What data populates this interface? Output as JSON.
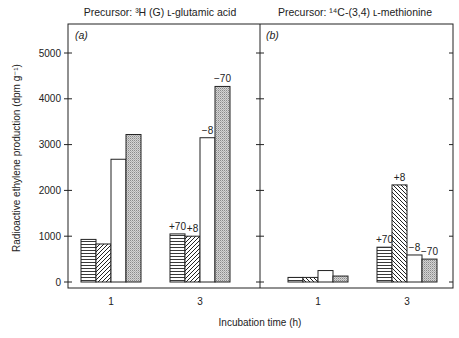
{
  "chart_data": [
    {
      "type": "bar",
      "panel_label": "(a)",
      "title": "Precursor: ³H (G) ʟ-glutamic acid",
      "xlabel": "Incubation time (h)",
      "ylabel": "Radioactive ethylene production (dpm g⁻¹)",
      "ylim": [
        0,
        5500
      ],
      "yticks": [
        0,
        1000,
        2000,
        3000,
        4000,
        5000
      ],
      "categories": [
        "1",
        "3"
      ],
      "series": [
        {
          "name": "horizontal-stripes",
          "pattern": "horizontal",
          "values": [
            930,
            1050
          ]
        },
        {
          "name": "diagonal-hatch",
          "pattern": "diagonal",
          "values": [
            830,
            1000
          ]
        },
        {
          "name": "open",
          "pattern": "open",
          "values": [
            2680,
            3150
          ]
        },
        {
          "name": "stippled",
          "pattern": "stipple",
          "values": [
            3220,
            4270
          ]
        }
      ],
      "annotations": [
        {
          "category": "3",
          "series": 0,
          "text": "+70"
        },
        {
          "category": "3",
          "series": 1,
          "text": "+8"
        },
        {
          "category": "3",
          "series": 2,
          "text": "−8"
        },
        {
          "category": "3",
          "series": 3,
          "text": "−70"
        }
      ]
    },
    {
      "type": "bar",
      "panel_label": "(b)",
      "title": "Precursor: ¹⁴C-(3,4) ʟ-methionine",
      "xlabel": "Incubation time (h)",
      "ylabel": "Radioactive ethylene production (dpm g⁻¹)",
      "ylim": [
        0,
        5500
      ],
      "yticks": [
        0,
        1000,
        2000,
        3000,
        4000,
        5000
      ],
      "categories": [
        "1",
        "3"
      ],
      "series": [
        {
          "name": "horizontal-stripes",
          "pattern": "horizontal",
          "values": [
            100,
            760
          ]
        },
        {
          "name": "diagonal-hatch",
          "pattern": "diagonal-reverse",
          "values": [
            100,
            2120
          ]
        },
        {
          "name": "open",
          "pattern": "open",
          "values": [
            250,
            590
          ]
        },
        {
          "name": "stippled",
          "pattern": "stipple",
          "values": [
            130,
            500
          ]
        }
      ],
      "annotations": [
        {
          "category": "3",
          "series": 0,
          "text": "+70"
        },
        {
          "category": "3",
          "series": 1,
          "text": "+8"
        },
        {
          "category": "3",
          "series": 2,
          "text": "−8"
        },
        {
          "category": "3",
          "series": 3,
          "text": "−70"
        }
      ]
    }
  ],
  "labels": {
    "xlabel": "Incubation time (h)",
    "ylabel": "Radioactive ethylene production (dpm g⁻¹)",
    "title_a": "Precursor: ³H (G) ʟ-glutamic acid",
    "title_b": "Precursor: ¹⁴C-(3,4) ʟ-methionine",
    "panel_a": "(a)",
    "panel_b": "(b)"
  },
  "colors": {
    "ink": "#222222",
    "stipple": "#9a9a9a",
    "background": "#ffffff"
  }
}
